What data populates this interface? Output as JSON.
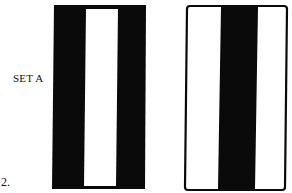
{
  "figure": {
    "item_number": "2.",
    "set_label": "SET A",
    "cards": [
      {
        "id": "left",
        "description": "black card with white vertical center stripe",
        "outer_color": "#0a0a0a",
        "stripe_color": "#ffffff",
        "pattern": [
          "black",
          "white",
          "black"
        ]
      },
      {
        "id": "right",
        "description": "white card with black border and black vertical center stripe",
        "outer_color": "#ffffff",
        "stripe_color": "#0a0a0a",
        "pattern": [
          "white",
          "black",
          "white"
        ]
      }
    ]
  }
}
